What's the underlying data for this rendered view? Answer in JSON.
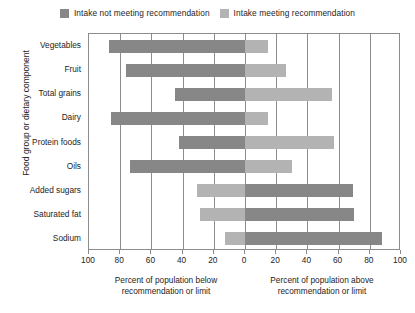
{
  "legend": {
    "items": [
      {
        "label": "Intake not meeting recommendation",
        "color": "#878787",
        "name": "legend-not-meeting"
      },
      {
        "label": "Intake meeting recommendation",
        "color": "#b3b3b3",
        "name": "legend-meeting"
      }
    ]
  },
  "axes": {
    "y_title": "Food group or dietary component",
    "x_caption_left_line1": "Percent of population below",
    "x_caption_left_line2": "recommendation or limit",
    "x_caption_right_line1": "Percent of population above",
    "x_caption_right_line2": "recommendation or limit",
    "x_ticks": [
      "100",
      "80",
      "60",
      "40",
      "20",
      "0",
      "20",
      "40",
      "60",
      "80",
      "100"
    ]
  },
  "chart_data": {
    "type": "bar",
    "orientation": "horizontal",
    "layout": "diverging",
    "title": "",
    "xlabel": "Percent of population below recommendation or limit / Percent of population above recommendation or limit",
    "ylabel": "Food group or dietary component",
    "xlim": [
      -100,
      100
    ],
    "xticks": [
      -100,
      -80,
      -60,
      -40,
      -20,
      0,
      20,
      40,
      60,
      80,
      100
    ],
    "xticklabels": [
      "100",
      "80",
      "60",
      "40",
      "20",
      "0",
      "20",
      "40",
      "60",
      "80",
      "100"
    ],
    "grid": true,
    "legend_position": "top",
    "categories": [
      "Vegetables",
      "Fruit",
      "Total grains",
      "Dairy",
      "Protein foods",
      "Oils",
      "Added sugars",
      "Saturated fat",
      "Sodium"
    ],
    "series": [
      {
        "name": "Percent below recommendation or limit",
        "side": "left",
        "values": [
          87,
          76,
          45,
          86,
          42,
          74,
          31,
          29,
          13
        ],
        "colors": [
          "#878787",
          "#878787",
          "#878787",
          "#878787",
          "#878787",
          "#878787",
          "#b3b3b3",
          "#b3b3b3",
          "#b3b3b3"
        ]
      },
      {
        "name": "Percent above recommendation or limit",
        "side": "right",
        "values": [
          15,
          26,
          56,
          15,
          57,
          30,
          69,
          70,
          88
        ],
        "colors": [
          "#b3b3b3",
          "#b3b3b3",
          "#b3b3b3",
          "#b3b3b3",
          "#b3b3b3",
          "#b3b3b3",
          "#878787",
          "#878787",
          "#878787"
        ]
      }
    ],
    "rows": [
      {
        "category": "Vegetables",
        "below": 87,
        "above": 15,
        "below_color": "#878787",
        "above_color": "#b3b3b3"
      },
      {
        "category": "Fruit",
        "below": 76,
        "above": 26,
        "below_color": "#878787",
        "above_color": "#b3b3b3"
      },
      {
        "category": "Total grains",
        "below": 45,
        "above": 56,
        "below_color": "#878787",
        "above_color": "#b3b3b3"
      },
      {
        "category": "Dairy",
        "below": 86,
        "above": 15,
        "below_color": "#878787",
        "above_color": "#b3b3b3"
      },
      {
        "category": "Protein foods",
        "below": 42,
        "above": 57,
        "below_color": "#878787",
        "above_color": "#b3b3b3"
      },
      {
        "category": "Oils",
        "below": 74,
        "above": 30,
        "below_color": "#878787",
        "above_color": "#b3b3b3"
      },
      {
        "category": "Added sugars",
        "below": 31,
        "above": 69,
        "below_color": "#b3b3b3",
        "above_color": "#878787"
      },
      {
        "category": "Saturated fat",
        "below": 29,
        "above": 70,
        "below_color": "#b3b3b3",
        "above_color": "#878787"
      },
      {
        "category": "Sodium",
        "below": 13,
        "above": 88,
        "below_color": "#b3b3b3",
        "above_color": "#878787"
      }
    ]
  }
}
